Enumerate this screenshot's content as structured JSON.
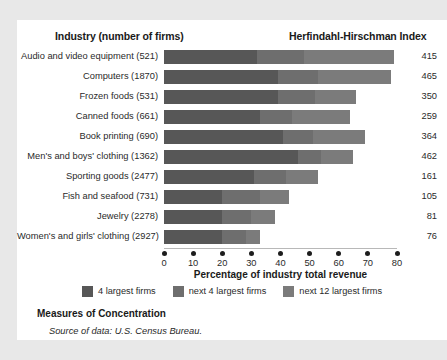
{
  "headers": {
    "industry": "Industry (number of firms)",
    "hhi": "Herfindahl-Hirschman Index"
  },
  "axis": {
    "xlabel": "Percentage of industry total revenue",
    "ticks": [
      "0",
      "10",
      "20",
      "30",
      "40",
      "50",
      "60",
      "70",
      "80"
    ]
  },
  "legend": [
    {
      "label": "4 largest firms",
      "color": "#575757"
    },
    {
      "label": "next 4 largest firms",
      "color": "#6e6e6e"
    },
    {
      "label": "next 12 largest firms",
      "color": "#7b7b7b"
    }
  ],
  "footer": {
    "title": "Measures of Concentration",
    "source": "Source of data: U.S. Census Bureau."
  },
  "rows": [
    {
      "label": "Audio and video equipment  (521)",
      "hhi": "415"
    },
    {
      "label": "Computers  (1870)",
      "hhi": "465"
    },
    {
      "label": "Frozen foods  (531)",
      "hhi": "350"
    },
    {
      "label": "Canned foods  (661)",
      "hhi": "259"
    },
    {
      "label": "Book printing  (690)",
      "hhi": "364"
    },
    {
      "label": "Men's and boys' clothing  (1362)",
      "hhi": "462"
    },
    {
      "label": "Sporting goods  (2477)",
      "hhi": "161"
    },
    {
      "label": "Fish and seafood  (731)",
      "hhi": "105"
    },
    {
      "label": "Jewelry  (2278)",
      "hhi": "81"
    },
    {
      "label": "Women's and girls' clothing  (2927)",
      "hhi": "76"
    }
  ],
  "chart_data": {
    "type": "bar",
    "orientation": "horizontal",
    "stacked": true,
    "title": "Measures of Concentration",
    "xlabel": "Percentage of industry total revenue",
    "ylabel": "Industry (number of firms)",
    "xlim": [
      0,
      80
    ],
    "xticks": [
      0,
      10,
      20,
      30,
      40,
      50,
      60,
      70,
      80
    ],
    "grid": false,
    "legend_position": "bottom",
    "categories": [
      "Audio and video equipment  (521)",
      "Computers  (1870)",
      "Frozen foods  (531)",
      "Canned foods  (661)",
      "Book printing  (690)",
      "Men's and boys' clothing  (1362)",
      "Sporting goods  (2477)",
      "Fish and seafood  (731)",
      "Jewelry  (2278)",
      "Women's and girls' clothing  (2927)"
    ],
    "series": [
      {
        "name": "4 largest firms",
        "values": [
          32,
          39,
          39,
          33,
          41,
          46,
          31,
          20,
          20,
          20
        ]
      },
      {
        "name": "next 4 largest firms",
        "values": [
          16,
          14,
          13,
          11,
          10,
          8,
          11,
          13,
          10,
          8
        ]
      },
      {
        "name": "next 12 largest firms",
        "values": [
          31,
          25,
          14,
          20,
          18,
          11,
          11,
          10,
          8,
          5
        ]
      }
    ],
    "secondary_column": {
      "name": "Herfindahl-Hirschman Index",
      "values": [
        415,
        465,
        350,
        259,
        364,
        462,
        161,
        105,
        81,
        76
      ]
    }
  }
}
